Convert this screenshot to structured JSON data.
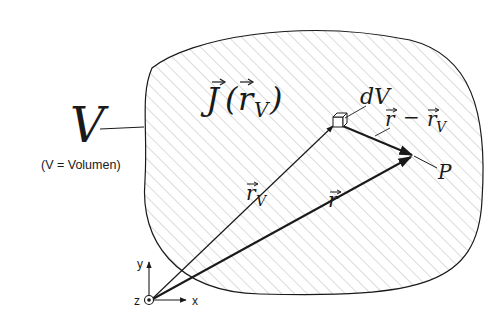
{
  "figure": {
    "volume_label": "V",
    "volume_caption": "(V = Volumen)",
    "current_density_label": {
      "symbol": "J",
      "arg_open": "(",
      "arg_symbol": "r",
      "arg_subscript": "V",
      "arg_close": ")"
    },
    "volume_element_label": "dV",
    "difference_vector_label": {
      "a": "r",
      "minus": "−",
      "b": "r",
      "b_subscript": "V"
    },
    "source_vector_label": {
      "symbol": "r",
      "subscript": "V"
    },
    "field_vector_label": {
      "symbol": "r"
    },
    "point_label": "P",
    "axes": {
      "x": "x",
      "y": "y",
      "z": "z"
    }
  },
  "colors": {
    "stroke": "#1a1a1a",
    "hatch": "#b5b5b5",
    "background": "#ffffff"
  }
}
